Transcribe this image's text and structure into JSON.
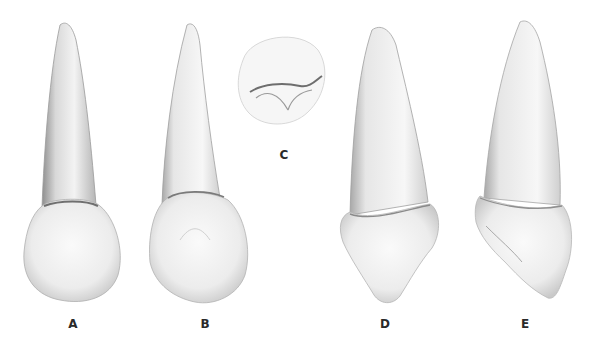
{
  "figure": {
    "views": [
      {
        "id": "A",
        "label": "A",
        "x": 73,
        "y": 317
      },
      {
        "id": "B",
        "label": "B",
        "x": 205,
        "y": 317
      },
      {
        "id": "C",
        "label": "C",
        "x": 284,
        "y": 148
      },
      {
        "id": "D",
        "label": "D",
        "x": 385,
        "y": 317
      },
      {
        "id": "E",
        "label": "E",
        "x": 525,
        "y": 317
      }
    ]
  }
}
